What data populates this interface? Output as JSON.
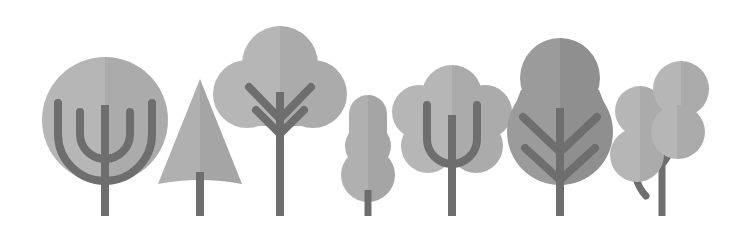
{
  "artwork": {
    "title": "Flat Design Tree Icon Set",
    "subject": "trees",
    "style": "flat vector illustration",
    "background_color": "#ffffff",
    "canvas": {
      "width": 736,
      "height": 241
    },
    "baseline_y": 216,
    "item_count": 7
  },
  "palette": {
    "background": "#ffffff",
    "canopy_light_left": "#b6b6b6",
    "canopy_light_right": "#ababab",
    "canopy_mid_left": "#b0b0b0",
    "canopy_mid_right": "#a5a5a5",
    "canopy_dark_left": "#9b9b9b",
    "canopy_dark_right": "#8f8f8f",
    "trunk": "#6e6e6e",
    "branch": "#6e6e6e"
  },
  "trees": [
    {
      "id": "tree-1",
      "name": "round-canopy-tree",
      "shape": "circle",
      "canopy_shade": "light",
      "branch_style": "nested-arcs",
      "center_x": 105,
      "canopy_top": 57,
      "canopy_bottom": 183,
      "canopy_radius": 63,
      "trunk_top": 105,
      "trunk_bottom": 216,
      "trunk_width": 8
    },
    {
      "id": "tree-2",
      "name": "conifer-tree",
      "shape": "triangle",
      "canopy_shade": "mid",
      "branch_style": "none",
      "center_x": 200,
      "canopy_top": 79,
      "canopy_bottom": 186,
      "canopy_half_width": 42,
      "trunk_top": 182,
      "trunk_bottom": 216,
      "trunk_width": 8
    },
    {
      "id": "tree-3",
      "name": "cloud-canopy-tree-tall",
      "shape": "three-lobe-cloud",
      "canopy_shade": "light",
      "branch_style": "double-v",
      "center_x": 280,
      "canopy_top": 26,
      "canopy_bottom": 128,
      "trunk_top": 92,
      "trunk_bottom": 216,
      "trunk_width": 8
    },
    {
      "id": "tree-4",
      "name": "stacked-blob-shrub",
      "shape": "three-stacked-circles",
      "canopy_shade": "mid",
      "branch_style": "none",
      "center_x": 368,
      "canopy_top": 95,
      "canopy_bottom": 196,
      "trunk_top": 192,
      "trunk_bottom": 216,
      "trunk_width": 7
    },
    {
      "id": "tree-5",
      "name": "flower-canopy-tree",
      "shape": "multi-lobe-cloud",
      "canopy_shade": "light",
      "branch_style": "trident-u",
      "center_x": 452,
      "canopy_top": 66,
      "canopy_bottom": 180,
      "trunk_top": 115,
      "trunk_bottom": 216,
      "trunk_width": 8
    },
    {
      "id": "tree-6",
      "name": "gourd-canopy-tree",
      "shape": "pear-gourd",
      "canopy_shade": "dark",
      "branch_style": "feather-chevron",
      "center_x": 560,
      "canopy_top": 38,
      "canopy_bottom": 185,
      "trunk_top": 108,
      "trunk_bottom": 216,
      "trunk_width": 8
    },
    {
      "id": "tree-7",
      "name": "berry-cluster-tree",
      "shape": "four-circle-cluster",
      "canopy_shade": "light",
      "branch_style": "curved-stems",
      "center_x": 662,
      "canopy_top": 61,
      "canopy_bottom": 182,
      "blob_count": 4,
      "trunk_top": 104,
      "trunk_bottom": 216,
      "trunk_width": 7
    }
  ]
}
